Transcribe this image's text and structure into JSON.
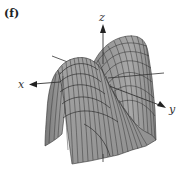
{
  "figure": {
    "panel_label": "(f)",
    "type": "3D surface plot",
    "axes": {
      "x_label": "x",
      "y_label": "y",
      "z_label": "z"
    },
    "colors": {
      "surface_fill": "#9a9a9a",
      "surface_dark": "#6e6e6e",
      "mesh_lines": "#2a2a2a",
      "axes": "#333333",
      "background": "#ffffff"
    }
  }
}
